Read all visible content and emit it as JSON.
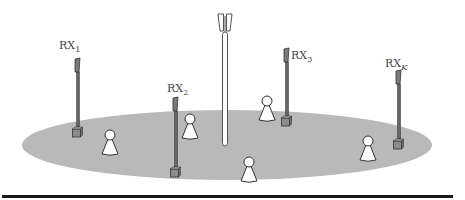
{
  "figure": {
    "coverage_area": {
      "cx": 227,
      "cy": 145,
      "rx": 205,
      "ry": 35,
      "fill": "#b9b9b9"
    },
    "transmitter": {
      "x": 225,
      "top": 14,
      "bottom": 146,
      "fill": "#ffffff",
      "stroke": "#555555"
    },
    "receivers": [
      {
        "id": "rx1",
        "base": "RX",
        "sub": "1",
        "label_x": 59,
        "label_y": 40,
        "pole_x": 78,
        "head_top": 58,
        "box_top": 127
      },
      {
        "id": "rx2",
        "base": "RX",
        "sub": "2",
        "label_x": 167,
        "label_y": 83,
        "pole_x": 176,
        "head_top": 97,
        "box_top": 167
      },
      {
        "id": "rx3",
        "base": "RX",
        "sub": "3",
        "label_x": 291,
        "label_y": 50,
        "pole_x": 287,
        "head_top": 48,
        "box_top": 116
      },
      {
        "id": "rxK",
        "base": "RX",
        "sub": "K",
        "label_x": 385,
        "label_y": 58,
        "pole_x": 399,
        "head_top": 70,
        "box_top": 139
      }
    ],
    "users": [
      {
        "x": 110,
        "top": 130
      },
      {
        "x": 190,
        "top": 114
      },
      {
        "x": 267,
        "top": 96
      },
      {
        "x": 368,
        "top": 136
      },
      {
        "x": 249,
        "top": 157
      }
    ],
    "colors": {
      "pole": "#666666",
      "head": "#7a7a7a",
      "outline": "#333333",
      "rule": "#1a1a1a"
    }
  }
}
